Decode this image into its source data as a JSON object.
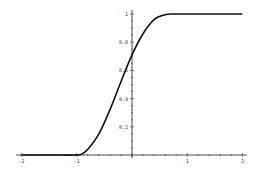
{
  "chart_data": {
    "type": "line",
    "title": "",
    "xlabel": "",
    "ylabel": "",
    "xlim": [
      -2,
      2
    ],
    "ylim": [
      0,
      1
    ],
    "grid": false,
    "legend": null,
    "x_ticks": [
      "-2",
      "-1",
      "1",
      "2"
    ],
    "y_ticks": [
      "0.2",
      "0.4",
      "0.6",
      "0.8",
      "1"
    ],
    "series": [
      {
        "name": "curve",
        "x": [
          -2,
          -1.5,
          -1,
          -0.9,
          -0.8,
          -0.6,
          -0.4,
          -0.2,
          0,
          0.2,
          0.4,
          0.6,
          0.75,
          1,
          1.5,
          2
        ],
        "y": [
          0,
          0,
          0,
          0.01,
          0.04,
          0.15,
          0.32,
          0.52,
          0.71,
          0.86,
          0.96,
          0.995,
          1,
          1,
          1,
          1
        ]
      }
    ]
  }
}
